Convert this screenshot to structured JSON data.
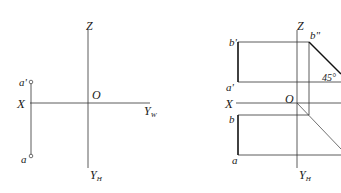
{
  "left_diagram": {
    "axes": {
      "z_label": "Z",
      "origin_label": "O",
      "x_label": "X",
      "yw_label": "Y",
      "yw_sub": "W",
      "yh_label": "Y",
      "yh_sub": "H"
    },
    "points": {
      "a_prime": "a'",
      "a": "a"
    }
  },
  "right_diagram": {
    "axes": {
      "z_label": "Z",
      "origin_label": "O",
      "x_label": "X",
      "yh_label": "Y",
      "yh_sub": "H"
    },
    "points": {
      "b_prime": "b'",
      "b_double_prime": "b\"",
      "a_prime": "a'",
      "b": "b",
      "a": "a"
    },
    "angle_label": "45°"
  },
  "colors": {
    "line": "#333333",
    "thick_line": "#111111"
  }
}
